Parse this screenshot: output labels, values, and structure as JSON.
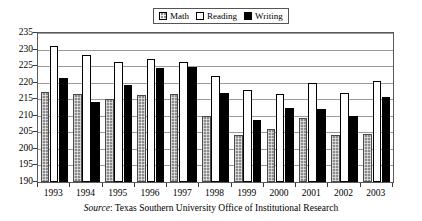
{
  "chart_data": {
    "type": "bar",
    "title": "",
    "subtitle": "",
    "xlabel": "",
    "ylabel": "",
    "categories": [
      "1993",
      "1994",
      "1995",
      "1996",
      "1997",
      "1998",
      "1999",
      "2000",
      "2001",
      "2002",
      "2003"
    ],
    "series": [
      {
        "name": "Math",
        "color": "#8c8c8c",
        "values": [
          217.1,
          216.5,
          215.2,
          216.2,
          216.5,
          209.8,
          204.2,
          206.1,
          209.2,
          204.1,
          204.6
        ]
      },
      {
        "name": "Reading",
        "color": "#ffffff",
        "values": [
          231.2,
          228.3,
          226.1,
          227.2,
          226.3,
          221.9,
          217.8,
          216.6,
          220.0,
          216.8,
          220.6
        ]
      },
      {
        "name": "Writing",
        "color": "#000000",
        "values": [
          221.4,
          214.3,
          219.4,
          224.5,
          224.6,
          217.0,
          208.7,
          212.4,
          212.0,
          209.9,
          215.8
        ]
      }
    ],
    "ylim": [
      190,
      235
    ],
    "ytick_step": 5,
    "yticks": [
      235,
      230,
      225,
      220,
      215,
      210,
      205,
      200,
      195,
      190
    ],
    "grid": true,
    "legend_position": "top-center",
    "legend_entries": [
      "Math",
      "Reading",
      "Writing"
    ]
  },
  "legend": {
    "entries": [
      {
        "label": "Math",
        "swatch": "math-swatch"
      },
      {
        "label": "Reading",
        "swatch": "reading-swatch"
      },
      {
        "label": "Writing",
        "swatch": "writing-swatch"
      }
    ]
  },
  "source": {
    "prefix": "Source",
    "separator": ":",
    "text": "Texas Southern University Office of Institutional Research",
    "full": "Source: Texas Southern University Office of Institutional Research"
  }
}
